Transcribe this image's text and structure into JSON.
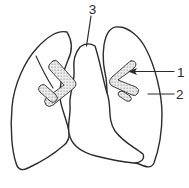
{
  "colors": {
    "line": "#2b2b2b",
    "background": "#ffffff",
    "stipple_dot": "#7c7c7c",
    "stipple_bg": "#ededed"
  },
  "annotations": {
    "label_1": "1",
    "label_2": "2",
    "label_3": "3"
  }
}
